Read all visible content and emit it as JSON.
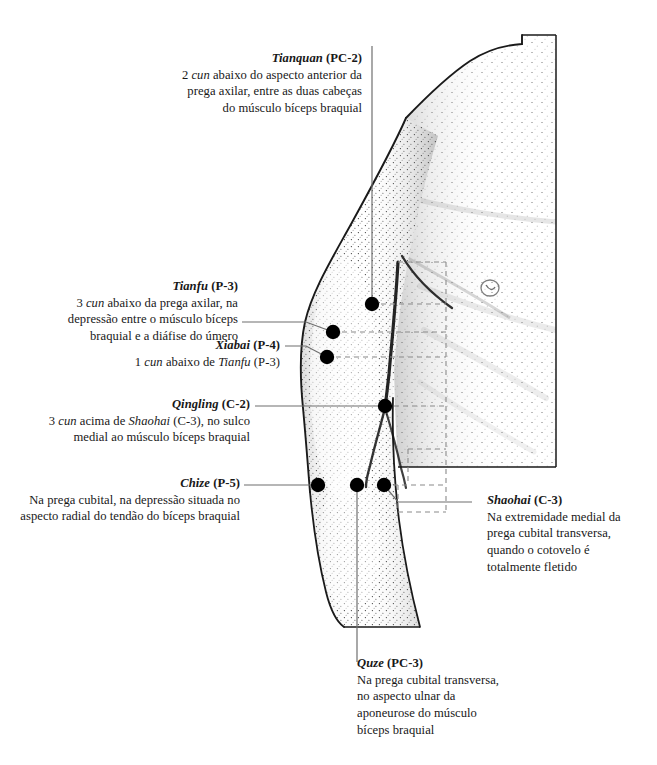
{
  "figure": {
    "kind": "anatomical-illustration",
    "language": "pt-BR"
  },
  "colors": {
    "background": "#ffffff",
    "ink": "#181818",
    "leader_line": "#6b6b6b",
    "dashed_line": "#8a8a8a",
    "point_marker": "#000000",
    "stipple": "#3a3a3a"
  },
  "annotations": [
    {
      "id": "tianquan",
      "name": "Tianquan",
      "code": "(PC-2)",
      "text": "2 cun abaixo do aspecto anterior da prega axilar, entre as duas cabeças do músculo bíceps braquial",
      "align": "right",
      "lines": [
        "2 cun abaixo do aspecto anterior da",
        "prega axilar, entre as duas cabeças",
        "do músculo bíceps braquial"
      ]
    },
    {
      "id": "tianfu",
      "name": "Tianfu",
      "code": "(P-3)",
      "text": "3 cun abaixo da prega axilar, na depressão entre o músculo bíceps braquial e a diáfise do úmero",
      "align": "right",
      "lines": [
        "3 cun abaixo da prega axilar, na",
        "depressão entre o músculo bíceps",
        "braquial e a diáfise do úmero"
      ]
    },
    {
      "id": "xiabai",
      "name": "Xiabai",
      "code": "(P-4)",
      "text": "1 cun abaixo de Tianfu (P-3)",
      "align": "right",
      "lines": [
        "1 cun abaixo de Tianfu (P-3)"
      ]
    },
    {
      "id": "qingling",
      "name": "Qingling",
      "code": "(C-2)",
      "text": "3 cun acima de Shaohai (C-3), no sulco medial ao músculo bíceps braquial",
      "align": "right",
      "lines": [
        "3 cun acima de Shaohai (C-3), no sulco",
        "medial ao músculo bíceps braquial"
      ]
    },
    {
      "id": "chize",
      "name": "Chize",
      "code": "(P-5)",
      "text": "Na prega cubital, na depressão situada no aspecto radial do tendão do bíceps braquial",
      "align": "right",
      "lines": [
        "Na prega cubital, na depressão situada no",
        "aspecto radial do tendão do bíceps braquial"
      ]
    },
    {
      "id": "shaohai",
      "name": "Shaohai",
      "code": "(C-3)",
      "text": "Na extremidade medial da prega cubital transversa, quando o cotovelo é totalmente fletido",
      "align": "left",
      "lines": [
        "Na extremidade medial da",
        "prega cubital transversa,",
        "quando o cotovelo é",
        "totalmente fletido"
      ]
    },
    {
      "id": "quze",
      "name": "Quze",
      "code": "(PC-3)",
      "text": "Na prega cubital transversa, no aspecto ulnar da aponeurose do músculo bíceps braquial",
      "align": "left",
      "lines": [
        "Na prega cubital transversa,",
        "no aspecto ulnar da",
        "aponeurose do músculo",
        "bíceps braquial"
      ]
    }
  ],
  "points": [
    {
      "id": "tianquan",
      "label": "Tianquan (PC-2)",
      "x": 372,
      "y": 304
    },
    {
      "id": "tianfu",
      "label": "Tianfu (P-3)",
      "x": 333,
      "y": 332
    },
    {
      "id": "xiabai",
      "label": "Xiabai (P-4)",
      "x": 327,
      "y": 357
    },
    {
      "id": "qingling",
      "label": "Qingling (C-2)",
      "x": 385,
      "y": 406
    },
    {
      "id": "chize",
      "label": "Chize (P-5)",
      "x": 318,
      "y": 485
    },
    {
      "id": "quze",
      "label": "Quze (PC-3)",
      "x": 357,
      "y": 485
    },
    {
      "id": "shaohai",
      "label": "Shaohai (C-3)",
      "x": 384,
      "y": 485
    }
  ]
}
